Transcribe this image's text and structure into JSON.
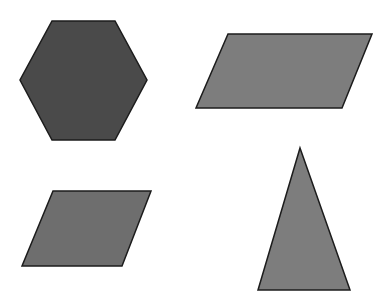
{
  "canvas": {
    "width": 387,
    "height": 299,
    "background_color": "#ffffff",
    "description": "Four filled gray geometric shapes on a plain white background"
  },
  "shapes": [
    {
      "id": "hexagon",
      "name": "hexagon",
      "label": "Hexagon",
      "position": "top-left",
      "fill_color": "#4a4a4a",
      "stroke_color": "#1c1c1c",
      "stroke_width": 1.5,
      "sides": 6,
      "points": "52,21 115,21 147,80 115,140 52,140 20,80",
      "bbox": {
        "x": 20,
        "y": 21,
        "width": 127,
        "height": 119
      }
    },
    {
      "id": "parallelogram-top-right",
      "name": "parallelogram",
      "label": "Parallelogram",
      "position": "top-right",
      "fill_color": "#7d7d7d",
      "stroke_color": "#1c1c1c",
      "stroke_width": 1.5,
      "sides": 4,
      "points": "228,34 372,34 342,108 196,108",
      "bbox": {
        "x": 196,
        "y": 34,
        "width": 176,
        "height": 74
      }
    },
    {
      "id": "parallelogram-bottom-left",
      "name": "parallelogram",
      "label": "Parallelogram",
      "position": "bottom-left",
      "fill_color": "#6e6e6e",
      "stroke_color": "#1c1c1c",
      "stroke_width": 1.5,
      "sides": 4,
      "points": "53,191 151,191 122,266 22,266",
      "bbox": {
        "x": 22,
        "y": 191,
        "width": 129,
        "height": 75
      }
    },
    {
      "id": "triangle",
      "name": "triangle",
      "label": "Triangle",
      "position": "bottom-right",
      "fill_color": "#7d7d7d",
      "stroke_color": "#1c1c1c",
      "stroke_width": 1.5,
      "sides": 3,
      "points": "300,148 350,290 258,290",
      "bbox": {
        "x": 258,
        "y": 148,
        "width": 92,
        "height": 142
      }
    }
  ]
}
